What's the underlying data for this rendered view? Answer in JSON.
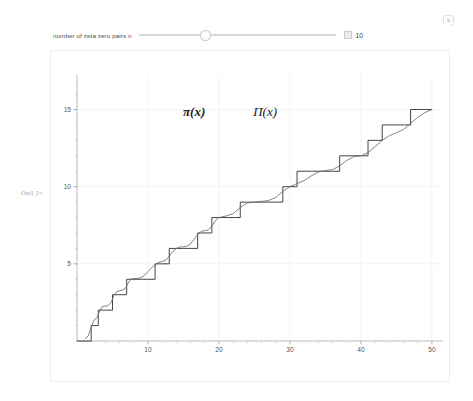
{
  "panel": {
    "out_label": "Out[ ]=",
    "options_icon": "options-gear-icon"
  },
  "control": {
    "label": "number of zeta zero pairs n",
    "value": "10",
    "value_number": 10,
    "min": 1,
    "max": 30,
    "stepper_icon": "stepper-box-icon",
    "thumb_icon": "slider-thumb"
  },
  "chart_data": {
    "type": "line",
    "title": "",
    "xlabel": "",
    "ylabel": "",
    "xlim": [
      0,
      51
    ],
    "ylim": [
      0,
      16.2
    ],
    "grid": true,
    "grid_color": "#f0f0f0",
    "xticks": [
      10,
      20,
      30,
      40,
      50
    ],
    "yticks": [
      5,
      10,
      15
    ],
    "xtick_labels": [
      "10",
      "20",
      "30",
      "40",
      "50"
    ],
    "ytick_labels": [
      "5",
      "10",
      "15"
    ],
    "xminor": [
      2,
      4,
      6,
      8,
      12,
      14,
      16,
      18,
      22,
      24,
      26,
      28,
      32,
      34,
      36,
      38,
      42,
      44,
      46,
      48
    ],
    "yminor": [
      1,
      2,
      3,
      4,
      6,
      7,
      8,
      9,
      11,
      12,
      13,
      14,
      16
    ],
    "annotations": [
      {
        "name": "pi-lower-label",
        "text": "π(x)",
        "x": 16.5,
        "y": 14.6,
        "bold": true
      },
      {
        "name": "pi-upper-label",
        "text": "Π(x)",
        "x": 26.5,
        "y": 14.6,
        "bold": false
      }
    ],
    "series": [
      {
        "name": "π(x)",
        "style": "step",
        "color": "#3a3a3a",
        "primes": [
          2,
          3,
          5,
          7,
          11,
          13,
          17,
          19,
          23,
          29,
          31,
          37,
          41,
          43,
          47
        ],
        "values": [
          0,
          0,
          1,
          2,
          2,
          3,
          3,
          4,
          4,
          4,
          4,
          5,
          5,
          6,
          6,
          6,
          6,
          7,
          7,
          8,
          8,
          8,
          8,
          9,
          9,
          9,
          9,
          9,
          9,
          10,
          10,
          11,
          11,
          11,
          11,
          11,
          11,
          12,
          12,
          12,
          12,
          13,
          13,
          14,
          14,
          14,
          14,
          15,
          15,
          15,
          15
        ],
        "x": [
          0,
          1,
          2,
          3,
          4,
          5,
          6,
          7,
          8,
          9,
          10,
          11,
          12,
          13,
          14,
          15,
          16,
          17,
          18,
          19,
          20,
          21,
          22,
          23,
          24,
          25,
          26,
          27,
          28,
          29,
          30,
          31,
          32,
          33,
          34,
          35,
          36,
          37,
          38,
          39,
          40,
          41,
          42,
          43,
          44,
          45,
          46,
          47,
          48,
          49,
          50
        ]
      },
      {
        "name": "Π(x)",
        "style": "smooth",
        "color": "#6a6a6a",
        "x": [
          1.2,
          1.6,
          2.0,
          2.4,
          2.8,
          3.2,
          3.6,
          4.0,
          4.4,
          4.8,
          5.2,
          5.6,
          6.0,
          6.4,
          6.8,
          7.2,
          7.6,
          8.0,
          8.5,
          9.0,
          9.5,
          10.0,
          10.5,
          11.0,
          11.5,
          12.0,
          12.5,
          13.0,
          13.5,
          14.0,
          14.5,
          15.0,
          15.5,
          16.0,
          16.5,
          17.0,
          17.5,
          18.0,
          18.5,
          19.0,
          19.5,
          20.0,
          21.0,
          22.0,
          23.0,
          24.0,
          25.0,
          26.0,
          27.0,
          28.0,
          29.0,
          30.0,
          31.0,
          32.0,
          33.0,
          34.0,
          35.0,
          36.0,
          37.0,
          38.0,
          39.0,
          40.0,
          41.0,
          42.0,
          43.0,
          44.0,
          45.0,
          46.0,
          47.0,
          48.0,
          49.0,
          50.0
        ],
        "values": [
          0.15,
          0.35,
          0.9,
          1.35,
          1.5,
          1.95,
          2.25,
          2.25,
          2.3,
          2.5,
          2.95,
          3.2,
          3.25,
          3.3,
          3.4,
          3.75,
          4.0,
          4.05,
          4.05,
          4.1,
          4.25,
          4.5,
          4.75,
          4.95,
          5.1,
          5.15,
          5.25,
          5.5,
          5.8,
          6.0,
          6.1,
          6.1,
          6.15,
          6.3,
          6.6,
          6.9,
          7.1,
          7.15,
          7.2,
          7.45,
          7.8,
          8.0,
          8.1,
          8.25,
          8.65,
          8.95,
          9.0,
          9.05,
          9.1,
          9.3,
          9.7,
          10.0,
          10.2,
          10.4,
          10.7,
          10.95,
          11.05,
          11.1,
          11.35,
          11.7,
          11.95,
          12.0,
          12.2,
          12.6,
          13.0,
          13.3,
          13.5,
          13.7,
          14.1,
          14.5,
          14.8,
          15.0
        ]
      }
    ]
  }
}
